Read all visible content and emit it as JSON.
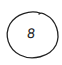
{
  "badge": {
    "value": "8",
    "stroke_color": "#222222",
    "background": "#ffffff"
  }
}
